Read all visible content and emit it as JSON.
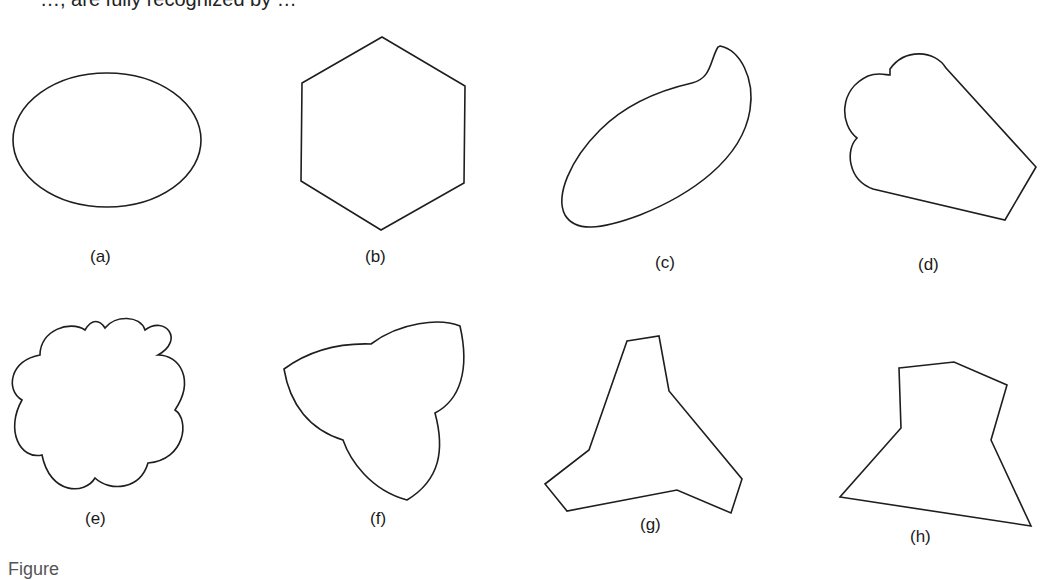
{
  "header": {
    "partial_text": "…, are fully recognized by …"
  },
  "footer": {
    "partial_caption": "Figure"
  },
  "figure": {
    "panels": [
      {
        "id": "a",
        "label": "(a)",
        "shape": "ellipse"
      },
      {
        "id": "b",
        "label": "(b)",
        "shape": "hexagon"
      },
      {
        "id": "c",
        "label": "(c)",
        "shape": "teardrop"
      },
      {
        "id": "d",
        "label": "(d)",
        "shape": "scalloped-quadrilateral"
      },
      {
        "id": "e",
        "label": "(e)",
        "shape": "scalloped-flower"
      },
      {
        "id": "f",
        "label": "(f)",
        "shape": "trefoil"
      },
      {
        "id": "g",
        "label": "(g)",
        "shape": "three-arm-polygon"
      },
      {
        "id": "h",
        "label": "(h)",
        "shape": "irregular-polygon"
      }
    ],
    "stroke_color": "#1e1e1e",
    "background_color": "#ffffff"
  }
}
